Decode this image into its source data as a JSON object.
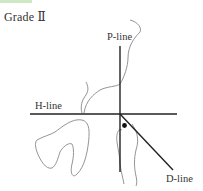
{
  "title": "Grade Ⅱ",
  "labels": {
    "p_line": "P-line",
    "h_line": "H-line",
    "d_line": "D-line"
  },
  "colors": {
    "line": "#222222",
    "outline": "#888888",
    "text": "#333333",
    "accent_bar": "#cfe8c4"
  }
}
